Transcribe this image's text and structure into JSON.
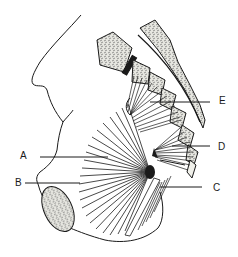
{
  "diagram": {
    "colors": {
      "line": "#1a1a1a",
      "bone_fill": "#e6e6e0",
      "background": "#ffffff"
    },
    "labels": [
      {
        "id": "A",
        "text": "A",
        "x": 20,
        "y": 151
      },
      {
        "id": "B",
        "text": "B",
        "x": 15,
        "y": 178
      },
      {
        "id": "C",
        "text": "C",
        "x": 213,
        "y": 183
      },
      {
        "id": "D",
        "text": "D",
        "x": 218,
        "y": 142
      },
      {
        "id": "E",
        "text": "E",
        "x": 219,
        "y": 96
      }
    ]
  }
}
